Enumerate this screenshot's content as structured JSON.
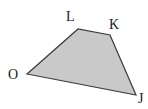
{
  "figure": {
    "name": "quadrilateral-jklo",
    "type": "polygon",
    "shape_label": "quadrilateral",
    "fill_color": "#c9c9c9",
    "stroke_color": "#3a3a3a",
    "background_color": "#ffffff",
    "stroke_width": 1.2,
    "canvas": {
      "width": 148,
      "height": 109
    },
    "vertices": [
      {
        "id": "O",
        "label": "O",
        "x": 27,
        "y": 74,
        "label_x": 8,
        "label_y": 68
      },
      {
        "id": "L",
        "label": "L",
        "x": 78,
        "y": 29,
        "label_x": 66,
        "label_y": 10
      },
      {
        "id": "K",
        "label": "K",
        "x": 110,
        "y": 35,
        "label_x": 109,
        "label_y": 18
      },
      {
        "id": "J",
        "label": "J",
        "x": 136,
        "y": 95,
        "label_x": 138,
        "label_y": 92
      }
    ],
    "edges": [
      {
        "from": "O",
        "to": "L",
        "name": "edge-ol"
      },
      {
        "from": "L",
        "to": "K",
        "name": "edge-lk"
      },
      {
        "from": "K",
        "to": "J",
        "name": "edge-kj"
      },
      {
        "from": "J",
        "to": "O",
        "name": "edge-jo"
      }
    ],
    "path_points": "27,74 78,29 110,35 136,95"
  }
}
